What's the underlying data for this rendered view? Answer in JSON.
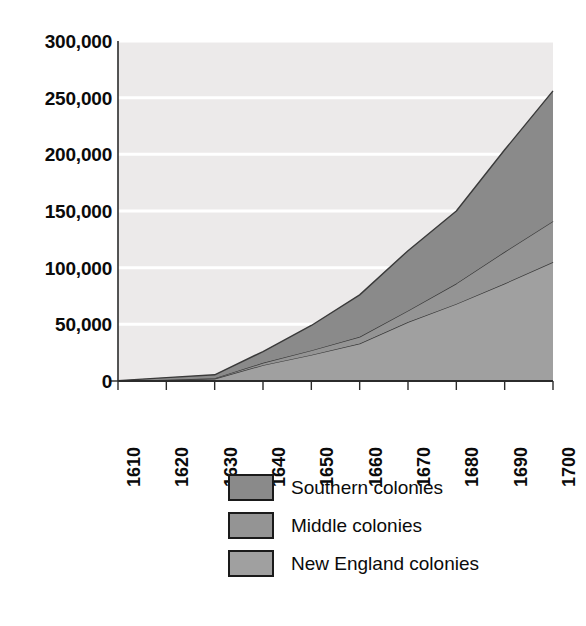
{
  "chart_data": {
    "type": "area",
    "title": "",
    "subtitle": "",
    "xlabel": "",
    "ylabel": "",
    "stacked": true,
    "grid": true,
    "legend_position": "bottom",
    "xlim": [
      1610,
      1700
    ],
    "ylim": [
      0,
      300000
    ],
    "x": [
      1610,
      1620,
      1630,
      1640,
      1650,
      1660,
      1670,
      1680,
      1690,
      1700
    ],
    "xtick_labels": [
      "1610",
      "1620",
      "1630",
      "1640",
      "1650",
      "1660",
      "1670",
      "1680",
      "1690",
      "1700"
    ],
    "ytick_labels": [
      "0",
      "50,000",
      "100,000",
      "150,000",
      "200,000",
      "250,000",
      "300,000"
    ],
    "ytick_values": [
      0,
      50000,
      100000,
      150000,
      200000,
      250000,
      300000
    ],
    "series": [
      {
        "name": "New England colonies",
        "color": "#a0a0a0",
        "values": [
          0,
          1000,
          2000,
          14000,
          23000,
          33000,
          52000,
          68000,
          86000,
          105000
        ]
      },
      {
        "name": "Middle colonies",
        "color": "#949494",
        "values": [
          0,
          0,
          500,
          2000,
          4000,
          6000,
          10000,
          18000,
          28000,
          36000
        ]
      },
      {
        "name": "Southern colonies",
        "color": "#8a8a8a",
        "values": [
          350,
          2000,
          3000,
          10000,
          22000,
          37000,
          53000,
          64000,
          90000,
          115000
        ]
      }
    ],
    "cumulative_totals": [
      350,
      3000,
      5500,
      26000,
      49000,
      76000,
      115000,
      150000,
      204000,
      256000
    ],
    "plot_background": "#eceaea",
    "gridline_color": "#ffffff",
    "axis_color": "#2b2b2b",
    "band_border_color": "#3a3a3a"
  },
  "legend": {
    "items": [
      {
        "label": "Southern colonies",
        "color": "#8a8a8a"
      },
      {
        "label": "Middle colonies",
        "color": "#949494"
      },
      {
        "label": "New England colonies",
        "color": "#a0a0a0"
      }
    ]
  },
  "bleed_through": {
    "line1": "ns Interact with Oceans to Cyclone",
    "line2": "ntium Geomagnetic",
    "line3": "ic Changes",
    "line4": "fferent Snow",
    "line5": "Arctic Ice Can",
    "line6": "Millions See"
  }
}
